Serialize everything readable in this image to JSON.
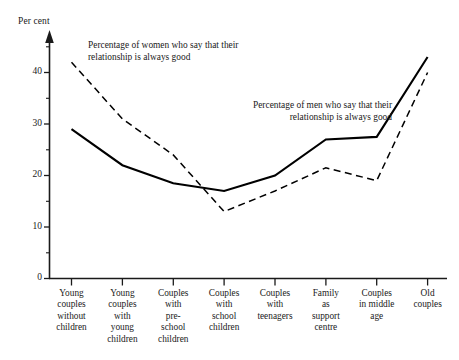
{
  "chart_data": {
    "type": "line",
    "title": "",
    "xlabel": "",
    "ylabel": "Per cent",
    "ylim": [
      0,
      45
    ],
    "yticks": [
      0,
      10,
      20,
      30,
      40
    ],
    "ytick_labels": [
      "0",
      "10",
      "20",
      "30",
      "40"
    ],
    "yminor_step": 5,
    "grid": false,
    "legend_position": "inline-annotations",
    "categories": [
      "Young couples without children",
      "Young couples with young children",
      "Couples with pre-school children",
      "Couples with school children",
      "Couples with teenagers",
      "Family as support centre",
      "Couples in middle age",
      "Old couples"
    ],
    "category_lines": [
      [
        "Young",
        "couples",
        "without",
        "children"
      ],
      [
        "Young",
        "couples",
        "with",
        "young",
        "children"
      ],
      [
        "Couples",
        "with",
        "pre-",
        "school",
        "children"
      ],
      [
        "Couples",
        "with",
        "school",
        "children"
      ],
      [
        "Couples",
        "with",
        "teenagers"
      ],
      [
        "Family",
        "as",
        "support",
        "centre"
      ],
      [
        "Couples",
        "in middle",
        "age"
      ],
      [
        "Old",
        "couples"
      ]
    ],
    "series": [
      {
        "name": "Percentage of men who say that their relationship is always good",
        "style": "solid",
        "color": "#000000",
        "values": [
          29,
          22,
          18.5,
          17,
          20,
          27,
          27.5,
          43
        ]
      },
      {
        "name": "Percentage of women who say that their relationship is always good",
        "style": "dashed",
        "color": "#000000",
        "values": [
          42,
          31,
          24,
          13,
          17,
          21.5,
          19,
          40
        ]
      }
    ],
    "annotations": [
      {
        "id": "women-annotation",
        "text": "Percentage of women who say that their\nrelationship is always good"
      },
      {
        "id": "men-annotation",
        "text": "Percentage of men who say that their\nrelationship is always good"
      }
    ]
  }
}
